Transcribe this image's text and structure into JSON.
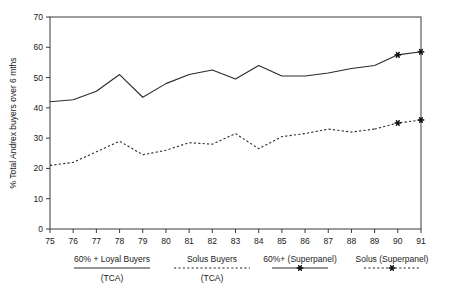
{
  "chart_data": {
    "type": "line",
    "title": "",
    "subtitle": "",
    "xlabel": "",
    "ylabel": "% Total Andrex buyers over 6 mths",
    "xlim": [
      75,
      91
    ],
    "ylim": [
      0,
      70
    ],
    "grid": false,
    "legend_position": "bottom",
    "x": [
      75,
      76,
      77,
      78,
      79,
      80,
      81,
      82,
      83,
      84,
      85,
      86,
      87,
      88,
      89,
      90,
      91
    ],
    "xtick_labels": [
      "75",
      "76",
      "77",
      "78",
      "79",
      "80",
      "81",
      "82",
      "83",
      "84",
      "85",
      "86",
      "87",
      "88",
      "89",
      "90",
      "91"
    ],
    "ytick_labels": [
      "0",
      "10",
      "20",
      "30",
      "40",
      "50",
      "60",
      "70"
    ],
    "ytick_values": [
      0,
      10,
      20,
      30,
      40,
      50,
      60,
      70
    ],
    "series": [
      {
        "name": "60% + Loyal Buyers (TCA)",
        "style": "solid",
        "markers": false,
        "x": [
          75,
          76,
          77,
          78,
          79,
          80,
          81,
          82,
          83,
          84,
          85,
          86,
          87,
          88,
          89
        ],
        "values": [
          42.0,
          42.7,
          45.5,
          51.0,
          43.5,
          48.0,
          51.0,
          52.5,
          49.5,
          54.0,
          50.5,
          50.5,
          51.5,
          53.0,
          54.0
        ]
      },
      {
        "name": "Solus Buyers (TCA)",
        "style": "dashed",
        "markers": false,
        "x": [
          75,
          76,
          77,
          78,
          79,
          80,
          81,
          82,
          83,
          84,
          85,
          86,
          87,
          88,
          89
        ],
        "values": [
          21.0,
          22.0,
          25.5,
          29.0,
          24.5,
          26.0,
          28.5,
          28.0,
          31.5,
          26.5,
          30.5,
          31.5,
          33.0,
          32.0,
          33.0
        ]
      },
      {
        "name": "60%+ (Superpanel)",
        "style": "solid",
        "markers": true,
        "x": [
          89,
          90,
          91
        ],
        "values": [
          54.0,
          57.5,
          58.5
        ]
      },
      {
        "name": "Solus (Superpanel)",
        "style": "dashed",
        "markers": true,
        "x": [
          89,
          90,
          91
        ],
        "values": [
          33.0,
          35.0,
          36.0
        ]
      }
    ],
    "legend": [
      {
        "line1": "60% + Loyal Buyers",
        "line2": "(TCA)",
        "style": "solid",
        "marker": false
      },
      {
        "line1": "Solus Buyers",
        "line2": "(TCA)",
        "style": "dashed",
        "marker": false
      },
      {
        "line1": "60%+ (Superpanel)",
        "line2": "",
        "style": "solid",
        "marker": true
      },
      {
        "line1": "Solus (Superpanel)",
        "line2": "",
        "style": "dashed",
        "marker": true
      }
    ],
    "colors": {
      "line": "#2b2b2b",
      "axis": "#3a3a3a",
      "text": "#1a1a1a",
      "background": "#ffffff"
    }
  }
}
